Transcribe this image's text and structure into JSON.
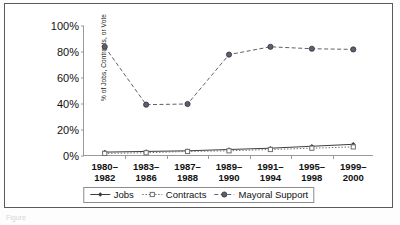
{
  "figure": {
    "background": "#ffffff",
    "frame_color": "#5a5a5a",
    "axis_color": "#9a9a9a",
    "bottom_crop_text": "Figure"
  },
  "chart_data": {
    "type": "line",
    "title": "",
    "xlabel": "",
    "ylabel": "% of Jobs, Contracts, or Vote",
    "ylim": [
      0,
      100
    ],
    "yticks": [
      0,
      20,
      40,
      60,
      80,
      100
    ],
    "ytick_labels": [
      "0%",
      "20%",
      "40%",
      "60%",
      "80%",
      "100%"
    ],
    "grid": false,
    "legend_position": "bottom-center",
    "categories": [
      "1980–1982",
      "1983–1986",
      "1987–1988",
      "1989–1990",
      "1991–1994",
      "1995–1998",
      "1999–2000"
    ],
    "category_lines": [
      [
        "1980–",
        "1982"
      ],
      [
        "1983–",
        "1986"
      ],
      [
        "1987–",
        "1988"
      ],
      [
        "1989–",
        "1990"
      ],
      [
        "1991–",
        "1994"
      ],
      [
        "1995–",
        "1998"
      ],
      [
        "1999–",
        "2000"
      ]
    ],
    "series": [
      {
        "name": "Jobs",
        "values": [
          3,
          3.5,
          4,
          5,
          6,
          7.5,
          9
        ],
        "color": "#3d3d3d",
        "line_style": "solid",
        "marker": "diamond"
      },
      {
        "name": "Contracts",
        "values": [
          2,
          2.5,
          3.5,
          4,
          5,
          6,
          7
        ],
        "color": "#6e6e6e",
        "line_style": "dotted",
        "marker": "square-open"
      },
      {
        "name": "Mayoral Support",
        "values": [
          84,
          39.5,
          40,
          78,
          84,
          82.5,
          82
        ],
        "color": "#5f5f6b",
        "line_style": "dashed",
        "marker": "circle"
      }
    ]
  },
  "legend": {
    "entries": [
      {
        "label": "Jobs"
      },
      {
        "label": "Contracts"
      },
      {
        "label": "Mayoral Support"
      }
    ]
  }
}
